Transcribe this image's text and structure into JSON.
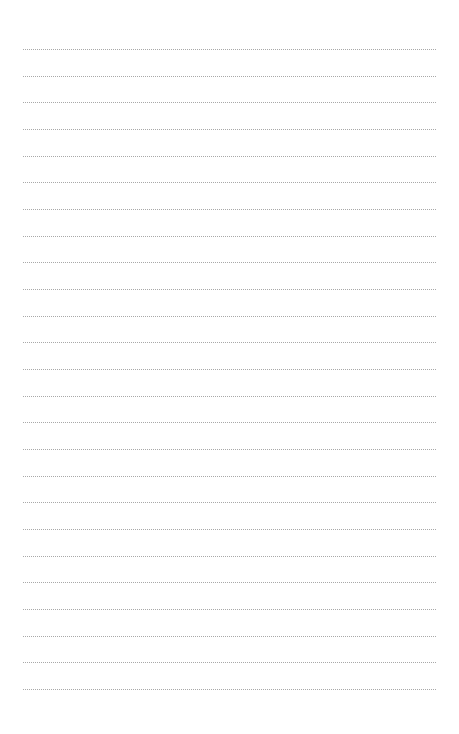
{
  "page": {
    "type": "lined-notebook-page",
    "background_color": "#ffffff",
    "line_color": "#a8a8a8",
    "line_style": "dotted",
    "line_count": 25,
    "first_line_y": 49,
    "line_spacing": 26.67,
    "line_left": 23,
    "line_right": 436
  }
}
